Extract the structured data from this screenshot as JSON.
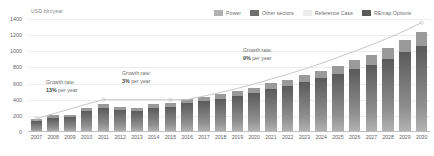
{
  "chart_data": {
    "type": "bar",
    "title": "",
    "subtitle": "",
    "xlabel": "",
    "ylabel": "USD bln/year",
    "ylim": [
      0,
      1400
    ],
    "ytick_values": [
      0,
      200,
      400,
      600,
      800,
      1000,
      1200,
      1400
    ],
    "ytick_labels": [
      "0",
      "200",
      "400",
      "600",
      "800",
      "1000",
      "1200",
      "1400"
    ],
    "grid": true,
    "legend_position": "top-right",
    "categories": [
      "2007",
      "2008",
      "2009",
      "2010",
      "2011",
      "2012",
      "2013",
      "2014",
      "2015",
      "2016",
      "2017",
      "2018",
      "2019",
      "2020",
      "2021",
      "2022",
      "2023",
      "2024",
      "2025",
      "2026",
      "2027",
      "2028",
      "2029",
      "2030"
    ],
    "series": [
      {
        "name": "Power",
        "color": "#6f6f6f",
        "values": [
          140,
          175,
          180,
          260,
          300,
          275,
          255,
          300,
          310,
          355,
          380,
          405,
          445,
          480,
          530,
          565,
          615,
          665,
          715,
          775,
          835,
          905,
          990,
          1070
        ]
      },
      {
        "name": "Other sectors",
        "color": "#9a9a9a",
        "values": [
          25,
          30,
          30,
          40,
          45,
          40,
          40,
          45,
          45,
          50,
          55,
          60,
          65,
          70,
          75,
          80,
          90,
          95,
          105,
          115,
          125,
          135,
          150,
          165
        ]
      }
    ],
    "reference_case": {
      "name": "Reference Case",
      "color": "#c8c8c8",
      "values": [
        165,
        225,
        285,
        345,
        400,
        400,
        400,
        400,
        400,
        400,
        445,
        490,
        540,
        595,
        655,
        715,
        780,
        850,
        925,
        1000,
        1080,
        1165,
        1255,
        1355
      ]
    },
    "remap_options": {
      "name": "REmap Options",
      "color": "#5a5a5a"
    },
    "annotations": [
      {
        "id": "growth-early",
        "line1": "Growth rate:",
        "rate": "13%",
        "line2_suffix": " per year",
        "span": "2007-2011"
      },
      {
        "id": "growth-mid",
        "line1": "Growth rate:",
        "rate": "3%",
        "line2_suffix": " per year",
        "span": "2011-2015"
      },
      {
        "id": "growth-late",
        "line1": "Growth rate:",
        "rate": "9%",
        "line2_suffix": " per year",
        "span": "2015-2030"
      }
    ]
  },
  "legend": {
    "items": [
      {
        "label": "Power",
        "color": "#b0b0b0"
      },
      {
        "label": "Other sectors",
        "color": "#6f6f6f"
      },
      {
        "label": "Reference Case",
        "color": "#ececec"
      },
      {
        "label": "REmap Options",
        "color": "#5a5a5a"
      }
    ]
  },
  "axis": {
    "y_title": "USD bln/year"
  }
}
